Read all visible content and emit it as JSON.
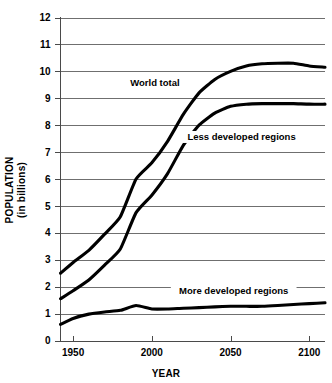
{
  "chart_data": {
    "type": "line",
    "title": "",
    "xlabel": "YEAR",
    "ylabel": "POPULATION\n(in billions)",
    "ylabel_line1": "POPULATION",
    "ylabel_line2": "(in billions)",
    "xlim": [
      1942,
      2110
    ],
    "ylim": [
      0,
      12
    ],
    "xticks": [
      1950,
      2000,
      2050,
      2100
    ],
    "xtick_labels": [
      "1950",
      "2000",
      "2050",
      "2100"
    ],
    "yticks": [
      0,
      1,
      2,
      3,
      4,
      5,
      6,
      7,
      8,
      9,
      10,
      11,
      12
    ],
    "ytick_labels": [
      "0",
      "1",
      "2",
      "3",
      "4",
      "5",
      "6",
      "7",
      "8",
      "9",
      "10",
      "11",
      "12"
    ],
    "grid": true,
    "grid_axis": "y",
    "legend": "inline-annotations",
    "line_color": "#000000",
    "grid_color": "#6f6f6f",
    "series": [
      {
        "name": "World total",
        "label": "World total",
        "label_year": 2002,
        "label_value": 9.45,
        "x": [
          1942,
          1950,
          1960,
          1970,
          1980,
          1990,
          2000,
          2010,
          2020,
          2030,
          2040,
          2050,
          2060,
          2070,
          2080,
          2090,
          2100,
          2110
        ],
        "values": [
          2.5,
          2.9,
          3.35,
          3.95,
          4.6,
          6.0,
          6.6,
          7.4,
          8.4,
          9.2,
          9.7,
          10.0,
          10.2,
          10.28,
          10.3,
          10.3,
          10.2,
          10.15
        ]
      },
      {
        "name": "Less developed regions",
        "label": "Less developed regions",
        "label_year": 2057,
        "label_value": 7.45,
        "x": [
          1942,
          1950,
          1960,
          1970,
          1980,
          1990,
          2000,
          2010,
          2020,
          2030,
          2040,
          2050,
          2060,
          2070,
          2080,
          2090,
          2100,
          2110
        ],
        "values": [
          1.55,
          1.85,
          2.25,
          2.8,
          3.4,
          4.75,
          5.4,
          6.2,
          7.25,
          8.0,
          8.45,
          8.7,
          8.78,
          8.8,
          8.8,
          8.8,
          8.78,
          8.78
        ]
      },
      {
        "name": "More developed regions",
        "label": "More developed regions",
        "label_year": 2052,
        "label_value": 1.72,
        "x": [
          1942,
          1950,
          1960,
          1970,
          1980,
          1990,
          2000,
          2010,
          2020,
          2030,
          2040,
          2050,
          2060,
          2070,
          2080,
          2090,
          2100,
          2110
        ],
        "values": [
          0.6,
          0.82,
          0.98,
          1.06,
          1.12,
          1.3,
          1.17,
          1.17,
          1.2,
          1.22,
          1.25,
          1.27,
          1.27,
          1.27,
          1.3,
          1.34,
          1.37,
          1.4
        ]
      }
    ]
  }
}
